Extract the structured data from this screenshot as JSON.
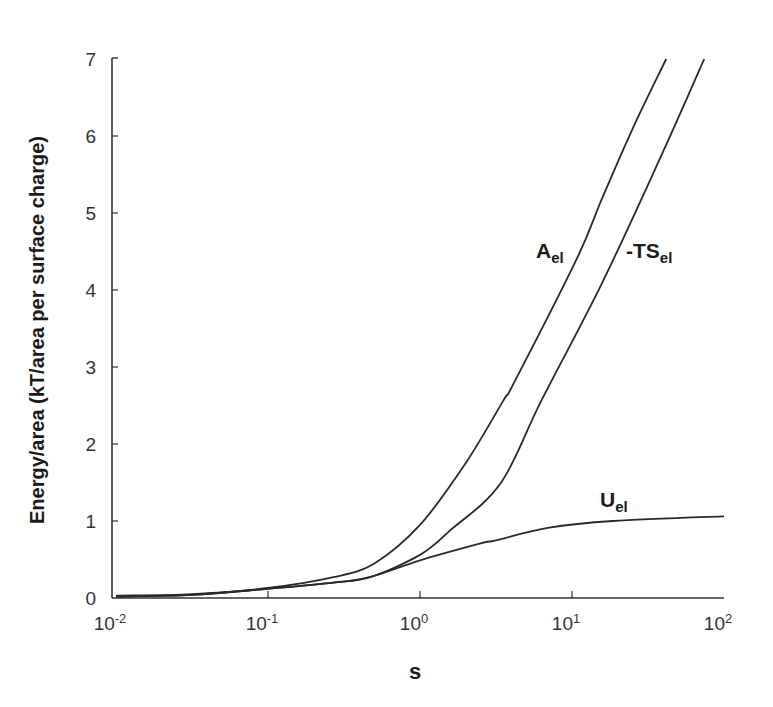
{
  "chart_data": {
    "type": "line",
    "title": "",
    "xlabel": "s",
    "ylabel": "Energy/area (kT/area per surface charge)",
    "xscale": "log",
    "xlim": [
      0.01,
      100
    ],
    "ylim": [
      0,
      7
    ],
    "grid": false,
    "legend": "inline labels",
    "x_ticks": [
      {
        "base": "10",
        "exp": "-2",
        "value": 0.01
      },
      {
        "base": "10",
        "exp": "-1",
        "value": 0.1
      },
      {
        "base": "10",
        "exp": "0",
        "value": 1
      },
      {
        "base": "10",
        "exp": "1",
        "value": 10
      },
      {
        "base": "10",
        "exp": "2",
        "value": 100
      }
    ],
    "y_ticks": [
      "0",
      "1",
      "2",
      "3",
      "4",
      "5",
      "6",
      "7"
    ],
    "series": [
      {
        "name": "A_el",
        "label_main": "A",
        "label_sub": "el",
        "log10_x": [
          -2,
          -1.5,
          -1,
          -0.57,
          -0.3,
          0,
          0.3,
          0.55,
          0.62,
          1.03,
          1.2,
          1.4,
          1.62
        ],
        "values": [
          0.03,
          0.05,
          0.13,
          0.27,
          0.45,
          0.95,
          1.75,
          2.57,
          2.8,
          4.4,
          5.2,
          6.1,
          7.0
        ]
      },
      {
        "name": "-TS_el",
        "label_main": "-TS",
        "label_sub": "el",
        "log10_x": [
          -2,
          -1.5,
          -1,
          -0.57,
          -0.33,
          0,
          0.2,
          0.53,
          0.8,
          1.2,
          1.6,
          1.87
        ],
        "values": [
          0.02,
          0.04,
          0.12,
          0.2,
          0.27,
          0.56,
          0.88,
          1.49,
          2.57,
          4.1,
          5.8,
          7.0
        ]
      },
      {
        "name": "U_el",
        "label_main": "U",
        "label_sub": "el",
        "log10_x": [
          -2,
          -1.5,
          -1,
          -0.57,
          -0.33,
          0,
          0.4,
          0.5,
          0.84,
          1.27,
          2
        ],
        "values": [
          0.02,
          0.04,
          0.12,
          0.2,
          0.27,
          0.49,
          0.71,
          0.75,
          0.91,
          1.0,
          1.06
        ]
      }
    ]
  },
  "labels": {
    "x_axis": "s",
    "y_axis": "Energy/area (kT/area per surface charge)",
    "series_a_main": "A",
    "series_a_sub": "el",
    "series_ts_main": "-TS",
    "series_ts_sub": "el",
    "series_u_main": "U",
    "series_u_sub": "el"
  }
}
